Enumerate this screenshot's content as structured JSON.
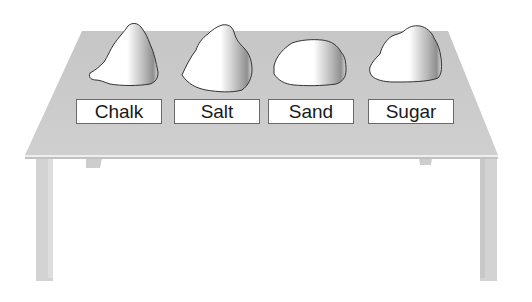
{
  "diagram": {
    "colors": {
      "table_top": "#c9c9c9",
      "table_edge": "#e6e6e6",
      "table_leg": "#d4d4d4",
      "sample_fill": "#ffffff",
      "sample_outline": "#333333",
      "label_border": "#6a6a6a",
      "label_text": "#1a1a1a"
    },
    "samples": [
      {
        "name": "Chalk",
        "label": "Chalk"
      },
      {
        "name": "Salt",
        "label": "Salt"
      },
      {
        "name": "Sand",
        "label": "Sand"
      },
      {
        "name": "Sugar",
        "label": "Sugar"
      }
    ]
  }
}
